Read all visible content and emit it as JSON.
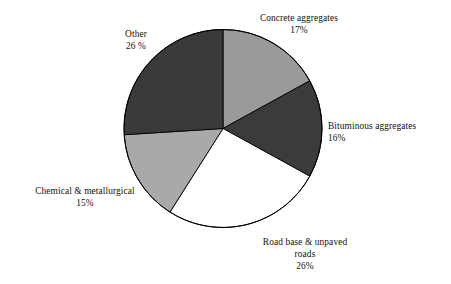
{
  "chart_data": {
    "type": "pie",
    "title": "",
    "subtitle": "",
    "xlabel": "",
    "ylabel": "",
    "legend_position": "outside-labels",
    "grid": false,
    "start_angle_deg": 0,
    "direction": "clockwise",
    "categories": [
      "Concrete aggregates",
      "Bituminous aggregates",
      "Road base & unpaved roads",
      "Chemical & metallurgical",
      "Other"
    ],
    "values": [
      17,
      16,
      26,
      15,
      26
    ],
    "unit": "%",
    "slices": [
      {
        "id": "concrete",
        "label": "Concrete aggregates",
        "value": 17,
        "value_text": "17%",
        "color": "#9a9a9a",
        "label_lines": [
          "Concrete aggregates",
          "17%"
        ]
      },
      {
        "id": "bituminous",
        "label": "Bituminous aggregates",
        "value": 16,
        "value_text": "16%",
        "color": "#3b3b3b",
        "label_lines": [
          "Bituminous aggregates",
          "16%"
        ]
      },
      {
        "id": "roadbase",
        "label": "Road base & unpaved roads",
        "value": 26,
        "value_text": "26%",
        "color": "#ffffff",
        "label_lines": [
          "Road base & unpaved",
          "roads",
          "26%"
        ]
      },
      {
        "id": "chemical",
        "label": "Chemical & metallurgical",
        "value": 15,
        "value_text": "15%",
        "color": "#a9a9a9",
        "label_lines": [
          "Chemical & metallurgical",
          "15%"
        ]
      },
      {
        "id": "other",
        "label": "Other",
        "value": 26,
        "value_text": "26 %",
        "color": "#3a3a3a",
        "label_lines": [
          "Other",
          "26 %"
        ]
      }
    ],
    "outline_color": "#000000"
  },
  "labels": {
    "concrete": {
      "line1": "Concrete aggregates",
      "line2": "17%"
    },
    "bituminous": {
      "line1": "Bituminous aggregates",
      "line2": "16%"
    },
    "roadbase": {
      "line1": "Road base & unpaved",
      "line2": "roads",
      "line3": "26%"
    },
    "chemical": {
      "line1": "Chemical & metallurgical",
      "line2": "15%"
    },
    "other": {
      "line1": "Other",
      "line2": "26 %"
    }
  }
}
